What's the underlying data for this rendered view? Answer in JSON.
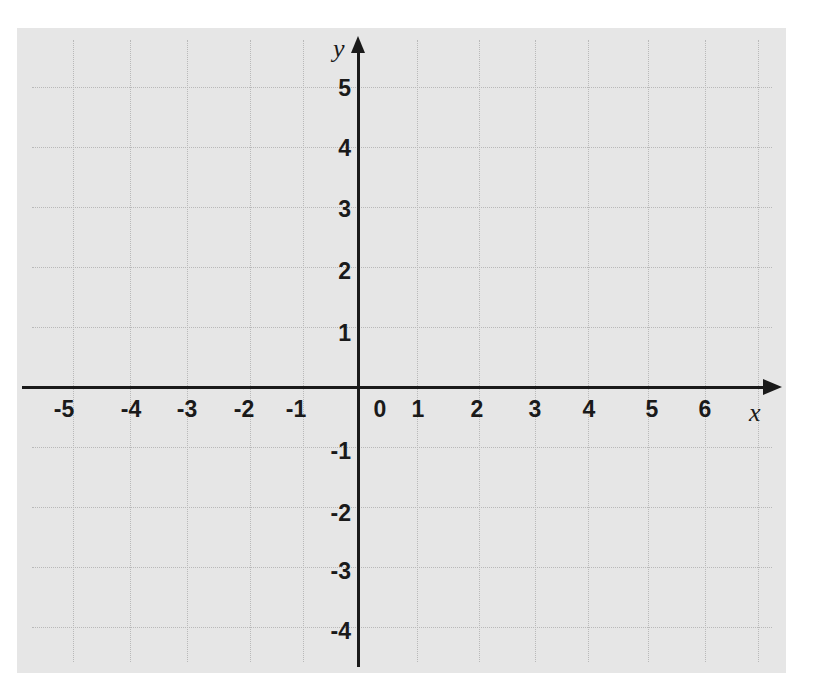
{
  "chart_data": {
    "type": "scatter",
    "title": "",
    "subtitle": "",
    "xlabel": "x",
    "ylabel": "y",
    "x_ticks": [
      "-5",
      "-4",
      "-3",
      "-2",
      "-1",
      "0",
      "1",
      "2",
      "3",
      "4",
      "5",
      "6"
    ],
    "y_ticks": [
      "5",
      "4",
      "3",
      "2",
      "1",
      "-1",
      "-2",
      "-3",
      "-4"
    ],
    "xlim": [
      -5.5,
      7
    ],
    "ylim": [
      -4.6,
      5.8
    ],
    "grid": true,
    "legend": null,
    "series": []
  },
  "axes": {
    "x_label": "x",
    "y_label": "y"
  },
  "colors": {
    "paper": "#e6e6e6",
    "grid": "#b9b9b9",
    "axis": "#1a1a1a",
    "background": "#ffffff"
  },
  "layout": {
    "vgrid_x": [
      73,
      130,
      187,
      250,
      303,
      417,
      479,
      535,
      588,
      648,
      705,
      758
    ],
    "hgrid_y": [
      87,
      147,
      207,
      267,
      327,
      447,
      507,
      567,
      627
    ],
    "x_tick_positions": [
      {
        "label": "-5",
        "x": 64
      },
      {
        "label": "-4",
        "x": 131
      },
      {
        "label": "-3",
        "x": 187
      },
      {
        "label": "-2",
        "x": 244
      },
      {
        "label": "-1",
        "x": 296
      },
      {
        "label": "0",
        "x": 380
      },
      {
        "label": "1",
        "x": 418
      },
      {
        "label": "2",
        "x": 477
      },
      {
        "label": "3",
        "x": 535
      },
      {
        "label": "4",
        "x": 589
      },
      {
        "label": "5",
        "x": 652
      },
      {
        "label": "6",
        "x": 705
      }
    ],
    "y_tick_positions": [
      {
        "label": "5",
        "y": 88
      },
      {
        "label": "4",
        "y": 148
      },
      {
        "label": "3",
        "y": 209
      },
      {
        "label": "2",
        "y": 271
      },
      {
        "label": "1",
        "y": 333
      },
      {
        "label": "-1",
        "y": 451
      },
      {
        "label": "-2",
        "y": 513
      },
      {
        "label": "-3",
        "y": 571
      },
      {
        "label": "-4",
        "y": 631
      }
    ]
  }
}
